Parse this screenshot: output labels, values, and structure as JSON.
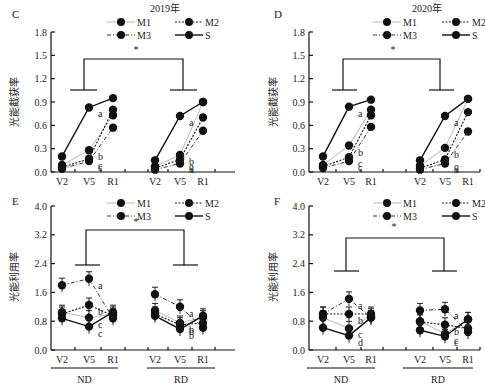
{
  "figure": {
    "legend_entries": [
      "M1",
      "M2",
      "M3",
      "S"
    ],
    "x_stages": [
      "V2",
      "V5",
      "R1"
    ],
    "groups": [
      "ND",
      "RD"
    ]
  },
  "chart_data": [
    {
      "panel": "C",
      "type": "line",
      "title": "2019年",
      "ylabel": "光能截获率",
      "xlabel": "",
      "ylim": [
        0.0,
        1.8
      ],
      "yticks": [
        "0.0",
        "0.3",
        "0.6",
        "0.9",
        "1.2",
        "1.5",
        "1.8"
      ],
      "categories": [
        "V2",
        "V5",
        "R1"
      ],
      "groups": [
        "ND",
        "RD"
      ],
      "legend": [
        "M1",
        "M2",
        "M3",
        "S"
      ],
      "significance": "*",
      "series": [
        {
          "name": "M1",
          "ND": [
            0.09,
            0.28,
            0.73
          ],
          "RD": [
            0.07,
            0.22,
            0.9
          ]
        },
        {
          "name": "M2",
          "ND": [
            0.06,
            0.17,
            0.8
          ],
          "RD": [
            0.05,
            0.16,
            0.7
          ]
        },
        {
          "name": "M3",
          "ND": [
            0.04,
            0.14,
            0.57
          ],
          "RD": [
            0.03,
            0.11,
            0.53
          ]
        },
        {
          "name": "S",
          "ND": [
            0.2,
            0.83,
            0.95
          ],
          "RD": [
            0.15,
            0.72,
            0.9
          ]
        }
      ],
      "letters": {
        "ND_V5": [
          "a",
          "b",
          "c",
          "c"
        ],
        "RD_V5": [
          "a",
          "b",
          "c",
          "d"
        ]
      }
    },
    {
      "panel": "D",
      "type": "line",
      "title": "2020年",
      "ylabel": "光能截获率",
      "xlabel": "",
      "ylim": [
        0.0,
        1.8
      ],
      "yticks": [
        "0.0",
        "0.3",
        "0.6",
        "0.9",
        "1.2",
        "1.5",
        "1.8"
      ],
      "categories": [
        "V2",
        "V5",
        "R1"
      ],
      "groups": [
        "ND",
        "RD"
      ],
      "legend": [
        "M1",
        "M2",
        "M3",
        "S"
      ],
      "significance": "*",
      "series": [
        {
          "name": "M1",
          "ND": [
            0.09,
            0.34,
            0.8
          ],
          "RD": [
            0.08,
            0.31,
            0.94
          ]
        },
        {
          "name": "M2",
          "ND": [
            0.07,
            0.19,
            0.73
          ],
          "RD": [
            0.05,
            0.16,
            0.77
          ]
        },
        {
          "name": "M3",
          "ND": [
            0.05,
            0.14,
            0.58
          ],
          "RD": [
            0.03,
            0.11,
            0.52
          ]
        },
        {
          "name": "S",
          "ND": [
            0.2,
            0.84,
            0.93
          ],
          "RD": [
            0.15,
            0.72,
            0.94
          ]
        }
      ],
      "letters": {
        "ND_V5": [
          "a",
          "b",
          "c",
          "c"
        ],
        "RD_V5": [
          "a",
          "b",
          "c",
          "d"
        ]
      }
    },
    {
      "panel": "E",
      "type": "line",
      "title": "",
      "ylabel": "光能利用率",
      "xlabel": "",
      "ylim": [
        0.0,
        4.0
      ],
      "yticks": [
        "0.0",
        "0.8",
        "1.6",
        "2.4",
        "3.2",
        "4.0"
      ],
      "categories": [
        "V2",
        "V5",
        "R1"
      ],
      "groups": [
        "ND",
        "RD"
      ],
      "legend": [
        "M1",
        "M2",
        "M3",
        "S"
      ],
      "significance": "*",
      "series": [
        {
          "name": "M1",
          "ND": [
            1.05,
            0.9,
            1.0
          ],
          "RD": [
            1.1,
            0.75,
            0.9
          ]
        },
        {
          "name": "M2",
          "ND": [
            1.0,
            1.25,
            0.95
          ],
          "RD": [
            1.0,
            0.7,
            0.75
          ]
        },
        {
          "name": "M3",
          "ND": [
            1.8,
            1.98,
            0.88
          ],
          "RD": [
            1.55,
            1.2,
            0.62
          ]
        },
        {
          "name": "S",
          "ND": [
            0.88,
            0.65,
            1.05
          ],
          "RD": [
            0.95,
            0.58,
            0.95
          ]
        }
      ],
      "letters": {
        "ND_V5": [
          "a",
          "b",
          "c",
          "c"
        ],
        "RD_V5": [
          "a",
          "b",
          "b",
          "b"
        ]
      }
    },
    {
      "panel": "F",
      "type": "line",
      "title": "",
      "ylabel": "光能利用率",
      "xlabel": "",
      "ylim": [
        0.0,
        4.0
      ],
      "yticks": [
        "0.0",
        "0.8",
        "1.6",
        "2.4",
        "3.2",
        "4.0"
      ],
      "categories": [
        "V2",
        "V5",
        "R1"
      ],
      "groups": [
        "ND",
        "RD"
      ],
      "legend": [
        "M1",
        "M2",
        "M3",
        "S"
      ],
      "significance": "*",
      "series": [
        {
          "name": "M1",
          "ND": [
            0.9,
            0.6,
            0.95
          ],
          "RD": [
            0.8,
            0.45,
            0.85
          ]
        },
        {
          "name": "M2",
          "ND": [
            1.0,
            1.0,
            1.0
          ],
          "RD": [
            0.78,
            0.7,
            0.6
          ]
        },
        {
          "name": "M3",
          "ND": [
            1.0,
            1.42,
            0.9
          ],
          "RD": [
            1.1,
            1.13,
            0.5
          ]
        },
        {
          "name": "S",
          "ND": [
            0.62,
            0.4,
            0.9
          ],
          "RD": [
            0.55,
            0.38,
            0.85
          ]
        }
      ],
      "letters": {
        "ND_V5": [
          "a",
          "b",
          "c",
          "d"
        ],
        "RD_V5": [
          "a",
          "b",
          "c",
          "c"
        ]
      }
    }
  ],
  "panels": {
    "C": {
      "label": "C",
      "year": "2019年",
      "ylabel": "光能截获率"
    },
    "D": {
      "label": "D",
      "year": "2020年",
      "ylabel": "光能截获率"
    },
    "E": {
      "label": "E",
      "ylabel": "光能利用率"
    },
    "F": {
      "label": "F",
      "ylabel": "光能利用率"
    }
  }
}
